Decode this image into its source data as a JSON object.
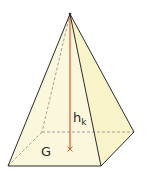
{
  "diagram": {
    "type": "square pyramid",
    "labels": {
      "height_main": "h",
      "height_sub": "k",
      "base": "G"
    },
    "colors": {
      "face_fill": "#fbf7dc",
      "right_face_fill": "#f8f3cc",
      "edge": "#2b2b2b",
      "hidden_edge": "#7a7a7a",
      "height_line": "#e0552f"
    },
    "vertices": {
      "apex": [
        70,
        14
      ],
      "front_left": [
        8,
        166
      ],
      "front_right": [
        101,
        166
      ],
      "back_right": [
        134,
        132
      ],
      "back_left": [
        42,
        132
      ],
      "foot": [
        70,
        149
      ]
    }
  }
}
